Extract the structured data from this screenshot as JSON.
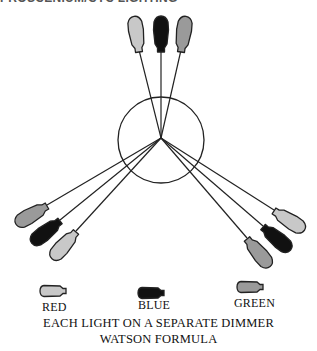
{
  "title": "PROSCENIUM/CYC LIGHTING",
  "colors": {
    "red_lamp": "#c8c8c8",
    "blue_lamp": "#111111",
    "green_lamp": "#9a9a9a",
    "outline": "#222222",
    "beam": "#222222"
  },
  "stage_circle": {
    "cx": 161,
    "cy": 140,
    "r": 43
  },
  "focal_point": {
    "x": 161,
    "y": 138
  },
  "lamp_groups": [
    {
      "name": "top",
      "lamps": [
        "red",
        "blue",
        "green"
      ]
    },
    {
      "name": "lower-left",
      "lamps": [
        "green",
        "blue",
        "red"
      ]
    },
    {
      "name": "lower-right",
      "lamps": [
        "red",
        "blue",
        "green"
      ]
    }
  ],
  "legend": [
    {
      "color": "red",
      "label": "RED"
    },
    {
      "color": "blue",
      "label": "BLUE"
    },
    {
      "color": "green",
      "label": "GREEN"
    }
  ],
  "caption": {
    "line1": "EACH LIGHT ON A SEPARATE DIMMER",
    "line2": "WATSON FORMULA"
  }
}
